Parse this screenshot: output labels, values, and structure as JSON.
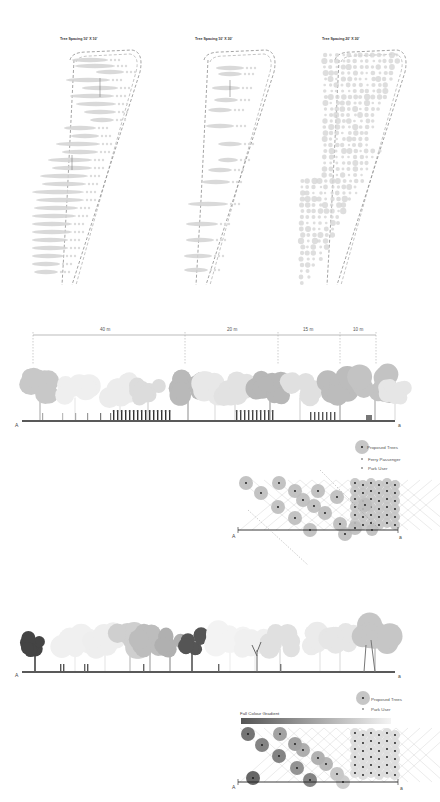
{
  "plans": [
    {
      "title": "Tree Spacing 10' X 10'",
      "pattern": "dense-chevron"
    },
    {
      "title": "Tree Spacing 10' X 30'",
      "pattern": "sparse-chevron"
    },
    {
      "title": "Tree Spacing 20' X 30'",
      "pattern": "dots"
    }
  ],
  "section1": {
    "dimensions": [
      "40 m",
      "20 m",
      "15 m",
      "10 m"
    ],
    "start_label": "A",
    "end_label": "a"
  },
  "diagram1": {
    "legend": [
      {
        "symbol": "proposed-tree",
        "label": "Proposed Trees"
      },
      {
        "symbol": "ferry-passenger",
        "label": "Ferry Passenger"
      },
      {
        "symbol": "park-user",
        "label": "Park User"
      }
    ],
    "diagonal_dims": [
      "40 m",
      "20 m",
      "15 m",
      "10 m"
    ],
    "top_dim": "5 m",
    "start_label": "A",
    "end_label": "a"
  },
  "section2": {
    "start_label": "A",
    "end_label": "a"
  },
  "diagram2": {
    "legend": [
      {
        "symbol": "proposed-tree",
        "label": "Proposed Trees"
      },
      {
        "symbol": "park-user",
        "label": "Park User"
      }
    ],
    "gradient_label": "Fall Colour Gradient",
    "start_label": "A",
    "end_label": "a"
  },
  "colors": {
    "tree_light": "#d9d9d9",
    "tree_mid": "#b5b5b5",
    "tree_dark": "#555555",
    "line": "#222222",
    "dash": "#666666"
  }
}
